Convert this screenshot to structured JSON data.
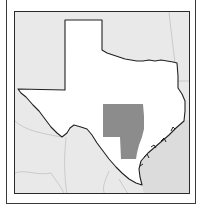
{
  "map": {
    "subject": "Texas",
    "highlighted_region": "Central Texas region",
    "colors": {
      "land_background": "#e9e9e9",
      "texas_fill": "#ffffff",
      "highlight_fill": "#8c8c8c",
      "gulf_fill": "#dcdcdc",
      "border_stroke": "#222222",
      "neighbor_lines": "#b5b5b5",
      "frame": "#2a2a2a"
    }
  }
}
